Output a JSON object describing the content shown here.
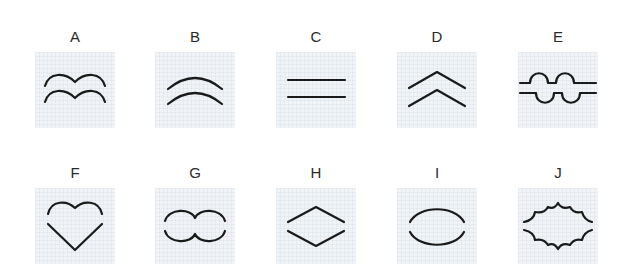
{
  "figure": {
    "title": "",
    "panels": [
      {
        "label": "A",
        "shape": "double-wave-arcs",
        "description": "two stacked double-hump arcs"
      },
      {
        "label": "B",
        "shape": "double-arcs",
        "description": "two stacked upward arcs"
      },
      {
        "label": "C",
        "shape": "parallel-lines",
        "description": "two horizontal parallel lines"
      },
      {
        "label": "D",
        "shape": "double-chevron",
        "description": "two stacked upward chevrons"
      },
      {
        "label": "E",
        "shape": "interlocking-bumps",
        "description": "line with bumps up over line with bumps down"
      },
      {
        "label": "F",
        "shape": "heart",
        "description": "heart outline split into top and bottom halves"
      },
      {
        "label": "G",
        "shape": "figure-eight",
        "description": "double-lobed horizontal shape split top and bottom"
      },
      {
        "label": "H",
        "shape": "diamond",
        "description": "diamond outline split into top and bottom halves"
      },
      {
        "label": "I",
        "shape": "ellipse",
        "description": "ellipse outline split into top and bottom arcs"
      },
      {
        "label": "J",
        "shape": "burst",
        "description": "scalloped starburst split into top and bottom halves"
      }
    ]
  },
  "colors": {
    "stroke": "#1a1a1a",
    "panel_bg": "#f1f4f7",
    "label": "#2a2a2a"
  }
}
